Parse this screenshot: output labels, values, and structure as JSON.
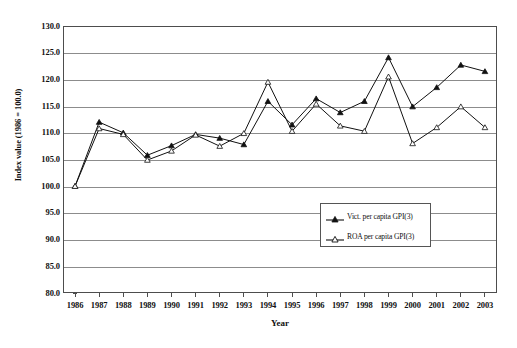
{
  "chart_data": {
    "type": "line",
    "title": "",
    "xlabel": "Year",
    "ylabel": "Index value (1986 = 100.0)",
    "ylim": [
      80.0,
      130.0
    ],
    "ytick_step": 5.0,
    "yticks": [
      "130.0",
      "125.0",
      "120.0",
      "115.0",
      "110.0",
      "105.0",
      "100.0",
      "95.0",
      "90.0",
      "85.0",
      "80.0"
    ],
    "ytick_values": [
      130.0,
      125.0,
      120.0,
      115.0,
      110.0,
      105.0,
      100.0,
      95.0,
      90.0,
      85.0,
      80.0
    ],
    "grid": true,
    "legend_position": "inside-lower-right",
    "categories": [
      "1986",
      "1987",
      "1988",
      "1989",
      "1990",
      "1991",
      "1992",
      "1993",
      "1994",
      "1995",
      "1996",
      "1997",
      "1998",
      "1999",
      "2000",
      "2001",
      "2002",
      "2003"
    ],
    "x": [
      1986,
      1987,
      1988,
      1989,
      1990,
      1991,
      1992,
      1993,
      1994,
      1995,
      1996,
      1997,
      1998,
      1999,
      2000,
      2001,
      2002,
      2003
    ],
    "series": [
      {
        "name": "Vict. per capita GPI(3)",
        "marker": "filled-triangle",
        "color": "#111111",
        "values": [
          100.0,
          112.0,
          110.0,
          105.8,
          107.6,
          109.7,
          109.0,
          107.8,
          115.9,
          111.5,
          116.4,
          113.8,
          115.9,
          124.1,
          114.9,
          118.5,
          122.7,
          121.5
        ]
      },
      {
        "name": "ROA per capita GPI(3)",
        "marker": "open-triangle",
        "color": "#111111",
        "values": [
          100.0,
          110.8,
          109.7,
          104.9,
          106.6,
          109.6,
          107.5,
          109.9,
          119.5,
          110.3,
          115.4,
          111.3,
          110.3,
          120.5,
          108.0,
          111.0,
          114.9,
          111.0
        ]
      }
    ]
  },
  "legend": {
    "items": [
      {
        "label": "Vict. per capita GPI(3)"
      },
      {
        "label": "ROA per capita GPI(3)"
      }
    ]
  },
  "axes": {
    "x_title": "Year",
    "y_title": "Index value (1986 = 100.0)"
  },
  "colors": {
    "axis": "#4d4d4d",
    "grid": "#8c8c8c",
    "series": "#111111",
    "background": "#ffffff"
  }
}
